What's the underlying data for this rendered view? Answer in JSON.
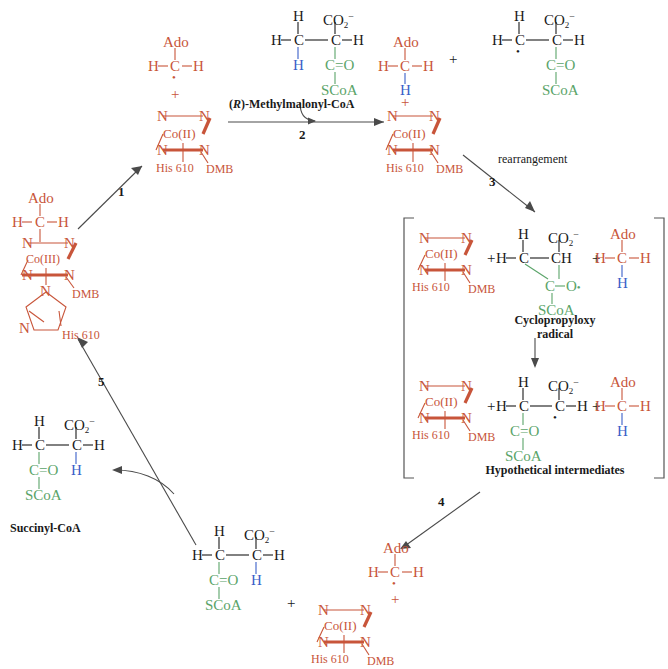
{
  "figure": {
    "colors": {
      "cobalamin": "#c8553a",
      "thioester": "#5aa469",
      "migrating_hydrogen": "#3a5fc8",
      "carbon_skeleton": "#1a1a1a",
      "arrow": "#4a4a4a",
      "bracket": "#555555"
    }
  },
  "labels": {
    "ado": "Ado",
    "H": "H",
    "C": "C",
    "N": "N",
    "O": "O",
    "co2": "CO",
    "co2_sub": "2",
    "co2_sup": "−",
    "co_ii": "Co(II)",
    "co_iii": "Co(III)",
    "his610": "His 610",
    "dmb": "DMB",
    "scoa": "SCoA",
    "c_eq_o": "C",
    "eq": "=",
    "plus": "+",
    "radical_dot": "•",
    "c_o_radical": "O"
  },
  "steps": [
    {
      "id": "1",
      "number": "1",
      "caption": ""
    },
    {
      "id": "2",
      "number": "2",
      "caption": ""
    },
    {
      "id": "3",
      "number": "3",
      "caption": "rearrangement"
    },
    {
      "id": "4",
      "number": "4",
      "caption": ""
    },
    {
      "id": "5",
      "number": "5",
      "caption": ""
    }
  ],
  "compound_names": {
    "methylmalonyl_coa": "(R)-Methylmalonyl-CoA",
    "methylmalonyl_coa_italic": "R",
    "methylmalonyl_coa_rest": ")-Methylmalonyl-CoA",
    "methylmalonyl_coa_open": "(",
    "cyclopropyloxy_line1": "Cyclopropyloxy",
    "cyclopropyloxy_line2": "radical",
    "hypothetical": "Hypothetical intermediates",
    "succinyl": "Succinyl-CoA"
  },
  "structures": {
    "ado_methyl_radical_top": {
      "ado": "Ado",
      "left_h": "H",
      "carbon": "C",
      "right_h": "H",
      "dot": "•"
    },
    "cob_ii_top": {
      "n1": "N",
      "n2": "N",
      "n3": "N",
      "n4": "N",
      "metal": "Co(II)",
      "axial_lower": "His 610",
      "axial_dmb": "DMB"
    },
    "cob_iii_left": {
      "ado": "Ado",
      "left_h": "H",
      "carbon": "C",
      "right_h": "H",
      "metal": "Co(III)",
      "n1": "N",
      "n2": "N",
      "n3": "N",
      "n4": "N",
      "dmb": "DMB",
      "imidazole_n_top": "N",
      "imidazole_n_left": "N",
      "his": "His 610"
    },
    "methylmalonyl_coa": {
      "top_h": "H",
      "co2": "CO",
      "co2_sub": "2",
      "co2_charge": "−",
      "left_h": "H",
      "c_left": "C",
      "c_right": "C",
      "right_h": "H",
      "bottom_h": "H",
      "carbonyl_c": "C",
      "carbonyl_o": "O",
      "scoa": "SCoA"
    },
    "methylmalonyl_radical": {
      "top_h": "H",
      "co2": "CO",
      "left_h": "H",
      "c_left": "C",
      "c_right": "C",
      "right_h": "H",
      "dot": "•",
      "carbonyl_c": "C",
      "carbonyl_o": "O",
      "scoa": "SCoA"
    },
    "ado_methane_top_right": {
      "ado": "Ado",
      "left_h": "H",
      "carbon": "C",
      "right_h": "H",
      "bottom_h": "H"
    },
    "cyclopropyloxy_radical": {
      "top_h": "H",
      "co2": "CO",
      "left_h": "H",
      "c_left": "C",
      "ch": "CH",
      "ring_c": "C",
      "ring_o": "O",
      "dot": "•",
      "scoa": "SCoA"
    },
    "succinyl_radical": {
      "top_h": "H",
      "co2": "CO",
      "left_h": "H",
      "c_left": "C",
      "c_right": "C",
      "right_h": "H",
      "dot": "•",
      "carbonyl_c": "C",
      "carbonyl_o": "O",
      "scoa": "SCoA"
    },
    "succinyl_coa": {
      "top_h": "H",
      "co2": "CO",
      "left_h": "H",
      "c_left": "C",
      "c_right": "C",
      "right_h": "H",
      "bottom_h": "H",
      "carbonyl_c": "C",
      "carbonyl_o": "O",
      "scoa": "SCoA"
    },
    "succinyl_coa_bottom": {
      "top_h": "H",
      "co2": "CO",
      "left_h": "H",
      "c_left": "C",
      "c_right": "C",
      "right_h": "H",
      "bottom_h": "H",
      "carbonyl_c": "C",
      "carbonyl_o": "O",
      "scoa": "SCoA"
    }
  }
}
